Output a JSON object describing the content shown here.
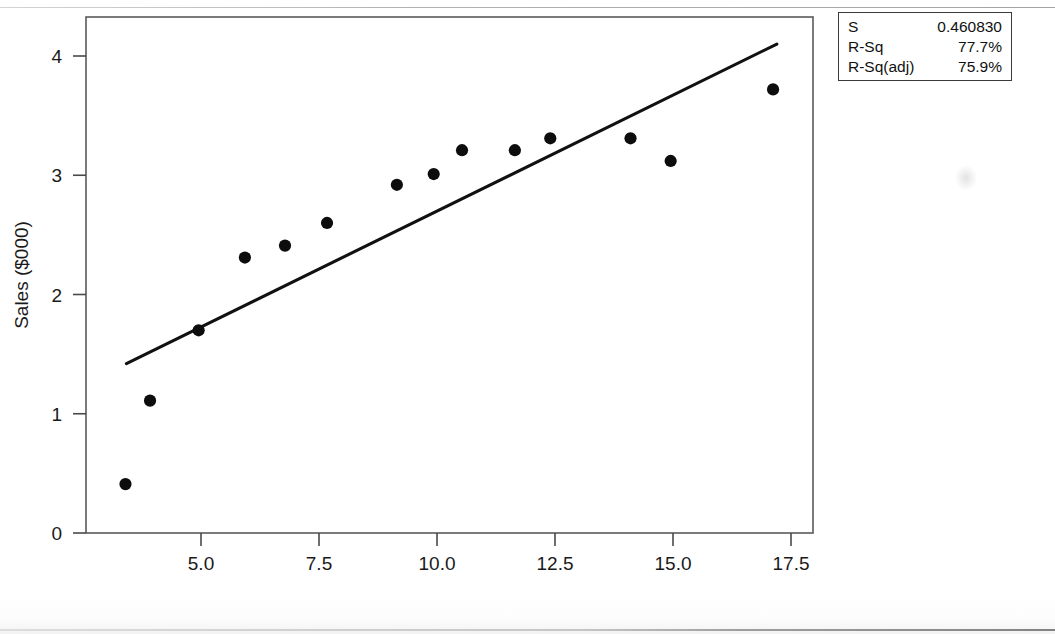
{
  "chart_data": {
    "type": "scatter",
    "title": "",
    "xlabel": "Advertising Expenditures ($000)",
    "ylabel": "Sales ($000)",
    "xlim": [
      2.9,
      18.1
    ],
    "ylim": [
      0,
      4.46
    ],
    "xticks": [
      "5.0",
      "7.5",
      "10.0",
      "12.5",
      "15.0",
      "17.5"
    ],
    "xtick_values": [
      5.0,
      7.5,
      10.0,
      12.5,
      15.0,
      17.5
    ],
    "yticks": [
      "0",
      "1",
      "2",
      "3",
      "4"
    ],
    "ytick_values": [
      0,
      1,
      2,
      3,
      4
    ],
    "grid": false,
    "legend": "none",
    "marker": "filled-circle",
    "marker_color": "#0d0d0d",
    "line_color": "#111111",
    "points": [
      {
        "x": 3.4,
        "y": 0.41
      },
      {
        "x": 3.92,
        "y": 1.11
      },
      {
        "x": 4.95,
        "y": 1.7
      },
      {
        "x": 5.93,
        "y": 2.31
      },
      {
        "x": 6.78,
        "y": 2.41
      },
      {
        "x": 7.67,
        "y": 2.6
      },
      {
        "x": 9.15,
        "y": 2.92
      },
      {
        "x": 9.93,
        "y": 3.01
      },
      {
        "x": 10.53,
        "y": 3.21
      },
      {
        "x": 11.65,
        "y": 3.21
      },
      {
        "x": 12.4,
        "y": 3.31
      },
      {
        "x": 14.1,
        "y": 3.31
      },
      {
        "x": 14.95,
        "y": 3.12
      },
      {
        "x": 17.12,
        "y": 3.72
      }
    ],
    "fit_line": {
      "name": "regression-line",
      "x_start": 3.42,
      "y_start": 1.42,
      "x_end": 17.2,
      "y_end": 4.1
    }
  },
  "stats_box": {
    "rows": [
      {
        "label": "S",
        "value": "0.460830"
      },
      {
        "label": "R-Sq",
        "value": "77.7%"
      },
      {
        "label": "R-Sq(adj)",
        "value": "75.9%"
      }
    ]
  },
  "title_partial": ""
}
